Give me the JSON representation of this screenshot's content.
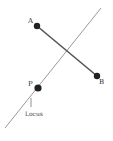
{
  "diagram": {
    "points": {
      "A": {
        "label": "A"
      },
      "B": {
        "label": "B"
      },
      "P": {
        "label": "P"
      }
    },
    "locus_label": "Locus",
    "colors": {
      "locus_line": "#9a9a9a",
      "segment": "#555555",
      "point": "#222222",
      "text": "#333333"
    }
  }
}
